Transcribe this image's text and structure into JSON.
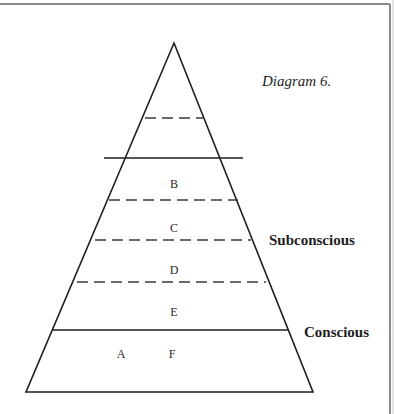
{
  "caption": "Diagram 6.",
  "side_labels": {
    "subconscious": "Subconscious",
    "conscious": "Conscious"
  },
  "levels": {
    "b": "B",
    "c": "C",
    "d": "D",
    "e": "E",
    "a": "A",
    "f": "F"
  },
  "colors": {
    "ink": "#1e1e1e",
    "frame": "#8a8a8a",
    "background": "#ffffff"
  }
}
